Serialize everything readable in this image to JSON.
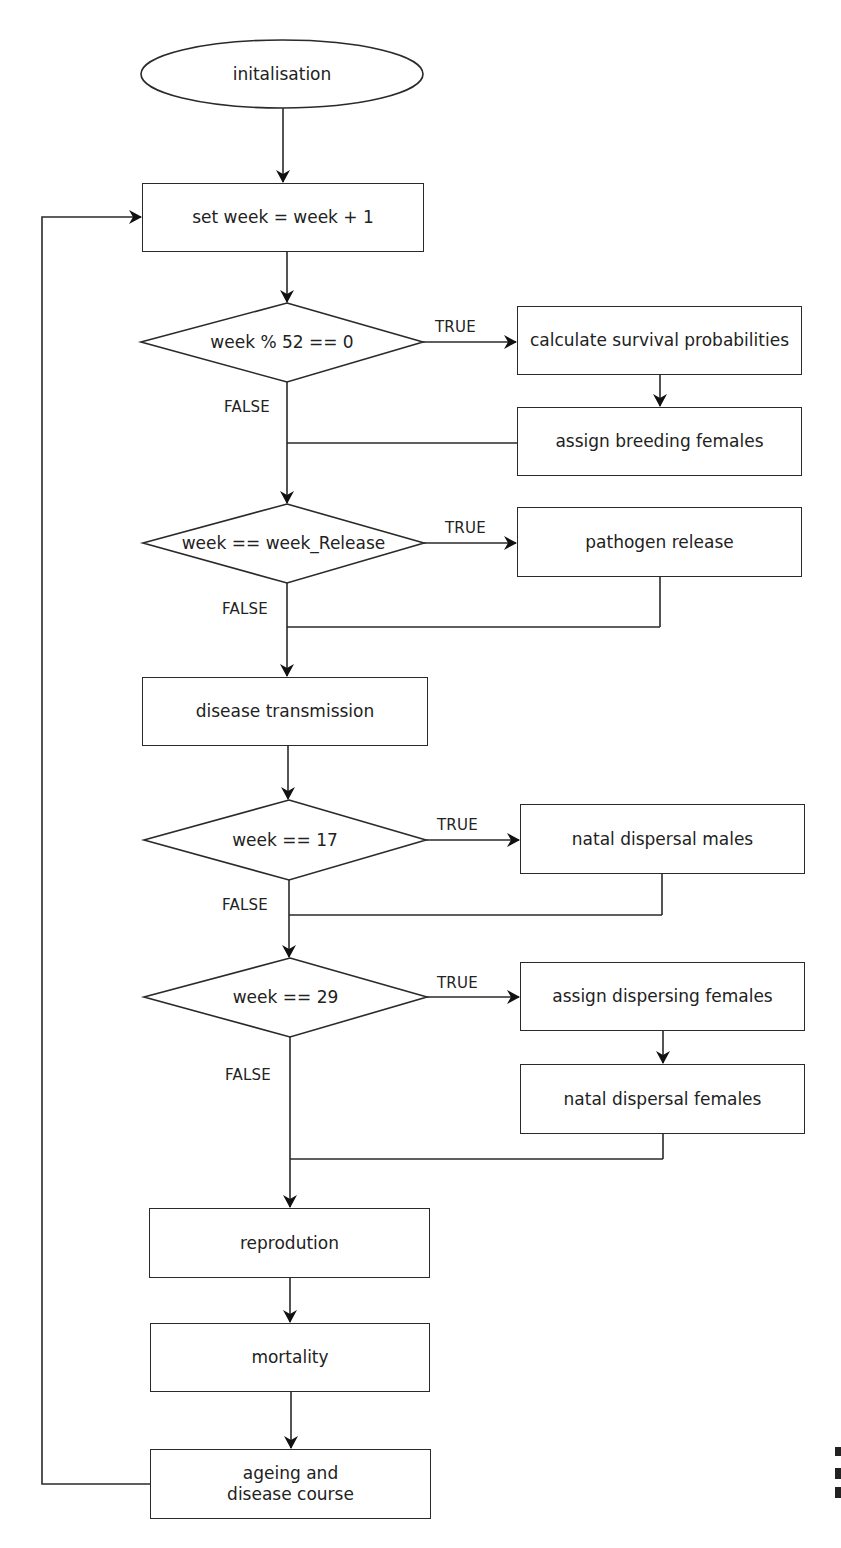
{
  "flowchart": {
    "start": {
      "label": "initalisation"
    },
    "step_increment": {
      "label": "set week = week + 1"
    },
    "decision_1": {
      "label": "week % 52 == 0",
      "true_label": "TRUE",
      "false_label": "FALSE"
    },
    "calc_survival": {
      "label": "calculate survival probabilities"
    },
    "assign_breeding": {
      "label": "assign breeding females"
    },
    "decision_2": {
      "label": "week == week_Release",
      "true_label": "TRUE",
      "false_label": "FALSE"
    },
    "pathogen_release": {
      "label": "pathogen release"
    },
    "disease_transmission": {
      "label": "disease transmission"
    },
    "decision_3": {
      "label": "week == 17",
      "true_label": "TRUE",
      "false_label": "FALSE"
    },
    "natal_males": {
      "label": "natal dispersal males"
    },
    "decision_4": {
      "label": "week == 29",
      "true_label": "TRUE",
      "false_label": "FALSE"
    },
    "assign_dispersing": {
      "label": "assign dispersing females"
    },
    "natal_females": {
      "label": "natal dispersal females"
    },
    "reproduction": {
      "label": "reprodution"
    },
    "mortality": {
      "label": "mortality"
    },
    "ageing": {
      "label_line1": "ageing and",
      "label_line2": "disease course"
    }
  },
  "colors": {
    "line": "#2a2a2a",
    "background": "#ffffff",
    "text": "#222222"
  }
}
